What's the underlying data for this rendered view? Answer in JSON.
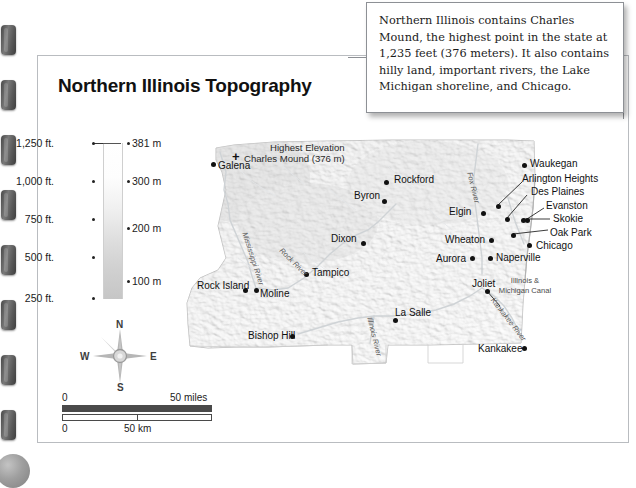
{
  "page": {
    "title": "Northern Illinois Topography"
  },
  "callout": {
    "text": "Northern Illinois contains Charles Mound, the highest point in the state at 1,235 feet (376 meters). It also contains hilly land, important rivers, the Lake Michigan shoreline, and Chicago."
  },
  "legend": {
    "feet_labels": [
      "1,250 ft.",
      "1,000 ft.",
      "750 ft.",
      "500 ft.",
      "250 ft."
    ],
    "meter_labels": [
      "381 m",
      "300 m",
      "200 m",
      "100 m"
    ],
    "gradient_top_color": "#ffffff",
    "gradient_bottom_color": "#c6c6c6"
  },
  "compass": {
    "north": "N",
    "south": "S",
    "east": "E",
    "west": "W"
  },
  "scale": {
    "miles_zero": "0",
    "miles_label": "50 miles",
    "km_zero": "0",
    "km_label": "50 km"
  },
  "map": {
    "highest_elevation_note": "Highest Elevation",
    "charles_mound_note": "Charles Mound (376 m)",
    "charles_mound_marker": "+",
    "canal_label": "Illinois & Michigan Canal",
    "cities": [
      {
        "name": "Galena",
        "lx": 40,
        "ly": 22,
        "dx": 33,
        "dy": 24
      },
      {
        "name": "Byron",
        "lx": 176,
        "ly": 52,
        "dx": 204,
        "dy": 61
      },
      {
        "name": "Rockford",
        "lx": 216,
        "ly": 36,
        "dx": 206,
        "dy": 42
      },
      {
        "name": "Dixon",
        "lx": 153,
        "ly": 95,
        "dx": 183,
        "dy": 103
      },
      {
        "name": "Tampico",
        "lx": 134,
        "ly": 129,
        "dx": 126,
        "dy": 134
      },
      {
        "name": "Rock Island",
        "lx": 19,
        "ly": 142,
        "dx": 65,
        "dy": 150
      },
      {
        "name": "Moline",
        "lx": 82,
        "ly": 150,
        "dx": 76,
        "dy": 150
      },
      {
        "name": "Bishop Hill",
        "lx": 70,
        "ly": 192,
        "dx": 112,
        "dy": 196
      },
      {
        "name": "La Salle",
        "lx": 217,
        "ly": 169,
        "dx": 215,
        "dy": 180
      },
      {
        "name": "Kankakee",
        "lx": 300,
        "ly": 205,
        "dx": 344,
        "dy": 208
      },
      {
        "name": "Joliet",
        "lx": 294,
        "ly": 140,
        "dx": 307,
        "dy": 151
      },
      {
        "name": "Aurora",
        "lx": 258,
        "ly": 115,
        "dx": 292,
        "dy": 118
      },
      {
        "name": "Naperville",
        "lx": 318,
        "ly": 114,
        "dx": 310,
        "dy": 118
      },
      {
        "name": "Wheaton",
        "lx": 267,
        "ly": 96,
        "dx": 311,
        "dy": 100
      },
      {
        "name": "Elgin",
        "lx": 271,
        "ly": 68,
        "dx": 303,
        "dy": 73
      },
      {
        "name": "Waukegan",
        "lx": 352,
        "ly": 20,
        "dx": 344,
        "dy": 25
      },
      {
        "name": "Arlington Heights",
        "lx": 344,
        "ly": 35,
        "dx": 318,
        "dy": 66
      },
      {
        "name": "Des Plaines",
        "lx": 353,
        "ly": 48,
        "dx": 327,
        "dy": 79
      },
      {
        "name": "Evanston",
        "lx": 368,
        "ly": 62,
        "dx": 347,
        "dy": 80
      },
      {
        "name": "Skokie",
        "lx": 375,
        "ly": 75,
        "dx": 343,
        "dy": 80
      },
      {
        "name": "Oak Park",
        "lx": 372,
        "ly": 89,
        "dx": 333,
        "dy": 95
      },
      {
        "name": "Chicago",
        "lx": 358,
        "ly": 102,
        "dx": 349,
        "dy": 105
      }
    ],
    "rivers": [
      {
        "name": "Mississippi River",
        "x": 71,
        "y": 93,
        "rot": 72
      },
      {
        "name": "Rock River",
        "x": 106,
        "y": 108,
        "rot": 45
      },
      {
        "name": "Illinois River",
        "x": 196,
        "y": 178,
        "rot": 76
      },
      {
        "name": "Fox River",
        "x": 296,
        "y": 33,
        "rot": 76
      },
      {
        "name": "Kankakee River",
        "x": 318,
        "y": 158,
        "rot": 52
      }
    ]
  }
}
